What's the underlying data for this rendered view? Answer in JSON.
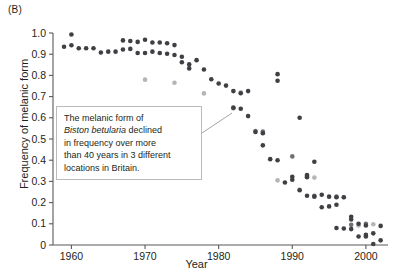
{
  "panel": {
    "label": "(B)"
  },
  "callout": {
    "line1": "The melanic form of",
    "species": "Biston betularia",
    "line2_rest": " declined",
    "line3": "in frequency over more",
    "line4": "than 40 years in 3 different",
    "line5": "locations in Britain."
  },
  "colors": {
    "series_dark": "#3f3f44",
    "series_mid": "#6f7074",
    "series_light": "#b4b5b7",
    "axis": "#58595b",
    "text": "#231f20",
    "callout_border": "#b9bcbe",
    "leader_line": "#9a9b9d",
    "background": "#ffffff"
  },
  "chart_data": {
    "type": "scatter",
    "title": "",
    "xlabel": "Year",
    "ylabel": "Frequency of melanic form",
    "xlim": [
      1957.5,
      2003
    ],
    "ylim": [
      0,
      1.0
    ],
    "xticks": [
      1960,
      1970,
      1980,
      1990,
      2000
    ],
    "xtick_labels": [
      "1960",
      "1970",
      "1980",
      "1990",
      "2000"
    ],
    "yticks": [
      0,
      0.1,
      0.2,
      0.3,
      0.4,
      0.5,
      0.6,
      0.7,
      0.8,
      0.9,
      1.0
    ],
    "ytick_labels": [
      "0",
      "0.1",
      "0.2",
      "0.3",
      "0.4",
      "0.5",
      "0.6",
      "0.7",
      "0.8",
      "0.9",
      "1.0"
    ],
    "grid": false,
    "legend": "none",
    "marker": "circle",
    "marker_size_px": 4.6,
    "series": [
      {
        "name": "location-1",
        "color": "#3f3f44",
        "points": [
          [
            1959,
            0.935
          ],
          [
            1960,
            0.942
          ],
          [
            1960,
            0.993
          ],
          [
            1961,
            0.928
          ],
          [
            1962,
            0.928
          ],
          [
            1963,
            0.928
          ],
          [
            1964,
            0.908
          ],
          [
            1965,
            0.912
          ],
          [
            1966,
            0.912
          ],
          [
            1967,
            0.922
          ],
          [
            1967,
            0.965
          ],
          [
            1968,
            0.962
          ],
          [
            1968,
            0.925
          ],
          [
            1969,
            0.958
          ],
          [
            1969,
            0.906
          ],
          [
            1970,
            0.968
          ],
          [
            1970,
            0.906
          ],
          [
            1971,
            0.955
          ],
          [
            1971,
            0.912
          ],
          [
            1972,
            0.955
          ],
          [
            1972,
            0.906
          ],
          [
            1973,
            0.952
          ],
          [
            1973,
            0.902
          ],
          [
            1974,
            0.943
          ],
          [
            1974,
            0.896
          ],
          [
            1975,
            0.888
          ],
          [
            1975,
            0.862
          ],
          [
            1976,
            0.852
          ],
          [
            1976,
            0.833
          ],
          [
            1977,
            0.872
          ],
          [
            1978,
            0.828
          ],
          [
            1979,
            0.782
          ],
          [
            1980,
            0.762
          ],
          [
            1981,
            0.752
          ],
          [
            1982,
            0.726
          ],
          [
            1982,
            0.648
          ],
          [
            1983,
            0.716
          ],
          [
            1983,
            0.643
          ],
          [
            1984,
            0.726
          ],
          [
            1984,
            0.608
          ],
          [
            1985,
            0.533
          ],
          [
            1986,
            0.527
          ],
          [
            1986,
            0.47
          ],
          [
            1987,
            0.405
          ],
          [
            1988,
            0.4
          ],
          [
            1988,
            0.806
          ],
          [
            1988,
            0.775
          ],
          [
            1989,
            0.295
          ],
          [
            1990,
            0.322
          ],
          [
            1990,
            0.308
          ],
          [
            1991,
            0.6
          ],
          [
            1991,
            0.258
          ],
          [
            1992,
            0.232
          ],
          [
            1992,
            0.33
          ],
          [
            1992,
            0.32
          ],
          [
            1993,
            0.393
          ],
          [
            1993,
            0.228
          ],
          [
            1994,
            0.237
          ],
          [
            1994,
            0.178
          ],
          [
            1995,
            0.182
          ],
          [
            1995,
            0.228
          ],
          [
            1996,
            0.225
          ],
          [
            1996,
            0.19
          ],
          [
            1996,
            0.08
          ],
          [
            1997,
            0.225
          ],
          [
            1997,
            0.078
          ],
          [
            1998,
            0.075
          ],
          [
            1998,
            0.133
          ],
          [
            1998,
            0.12
          ],
          [
            1999,
            0.04
          ],
          [
            1999,
            0.1
          ],
          [
            2000,
            0.04
          ],
          [
            2000,
            0.092
          ],
          [
            2000,
            0.048
          ],
          [
            2001,
            0.055
          ],
          [
            2001,
            0.005
          ],
          [
            2002,
            0.09
          ],
          [
            2002,
            0.022
          ]
        ]
      },
      {
        "name": "location-2",
        "color": "#6f7074",
        "points": [
          [
            1982,
            0.645
          ],
          [
            1985,
            0.538
          ],
          [
            1986,
            0.535
          ],
          [
            1990,
            0.418
          ],
          [
            1992,
            0.325
          ],
          [
            1993,
            0.232
          ],
          [
            1996,
            0.228
          ],
          [
            1998,
            0.095
          ],
          [
            2000,
            0.1
          ]
        ]
      },
      {
        "name": "location-3",
        "color": "#b4b5b7",
        "points": [
          [
            1970,
            0.78
          ],
          [
            1974,
            0.765
          ],
          [
            1978,
            0.715
          ],
          [
            1983,
            0.72
          ],
          [
            1988,
            0.305
          ],
          [
            1991,
            0.262
          ],
          [
            1993,
            0.318
          ],
          [
            1997,
            0.225
          ],
          [
            1999,
            0.092
          ],
          [
            2001,
            0.098
          ]
        ]
      }
    ]
  }
}
